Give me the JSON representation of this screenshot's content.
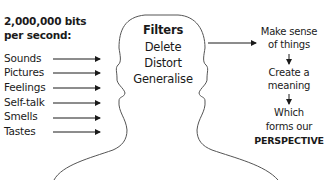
{
  "input_panel": {
    "heading_line1": "2,000,000 bits",
    "heading_line2": "per second:",
    "items": [
      {
        "label": "Sounds"
      },
      {
        "label": "Pictures"
      },
      {
        "label": "Feelings"
      },
      {
        "label": "Self-talk"
      },
      {
        "label": "Smells"
      },
      {
        "label": "Tastes"
      }
    ]
  },
  "head": {
    "title": "Filters",
    "filters": [
      "Delete",
      "Distort",
      "Generalise"
    ]
  },
  "output_flow": {
    "step1_line1": "Make sense",
    "step1_line2": "of things",
    "step2_line1": "Create a",
    "step2_line2": "meaning",
    "step3_line1": "Which",
    "step3_line2": "forms our",
    "step3_line3": "PERSPECTIVE"
  },
  "colors": {
    "text": "#1a1a1a",
    "outline": "#555555",
    "background": "#ffffff"
  }
}
